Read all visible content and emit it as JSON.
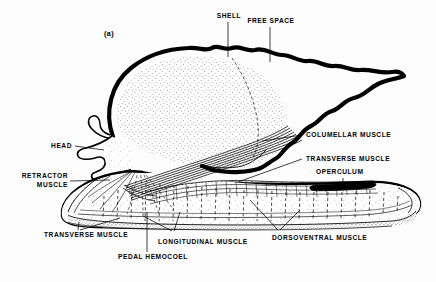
{
  "figure": {
    "panel_label": "(a)",
    "background_color": "#fdfdfd",
    "ink_color": "#000000"
  },
  "labels": {
    "shell": "SHELL",
    "free_space": "FREE SPACE",
    "columellar_muscle": "COLUMELLAR MUSCLE",
    "transverse_muscle_right": "TRANSVERSE MUSCLE",
    "operculum": "OPERCULUM",
    "head": "HEAD",
    "retractor_muscle_line1": "RETRACTOR",
    "retractor_muscle_line2": "MUSCLE",
    "transverse_muscle_bottom": "TRANSVERSE MUSCLE",
    "longitudinal_muscle": "LONGITUDINAL MUSCLE",
    "dorsoventral_muscle": "DORSOVENTRAL MUSCLE",
    "pedal_hemocoel": "PEDAL HEMOCOEL"
  }
}
